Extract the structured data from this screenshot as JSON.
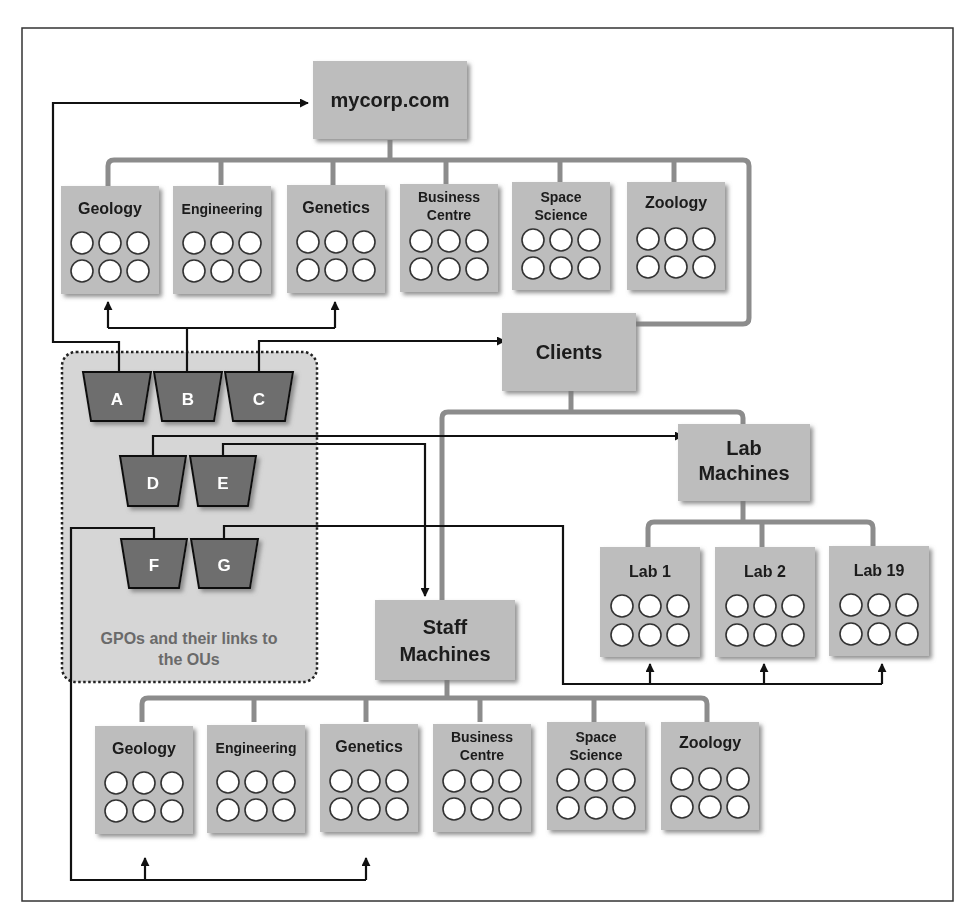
{
  "diagram": {
    "root": {
      "label": "mycorp.com"
    },
    "top_ous": [
      {
        "label_lines": [
          "Geology"
        ]
      },
      {
        "label_lines": [
          "Engineering"
        ]
      },
      {
        "label_lines": [
          "Genetics"
        ]
      },
      {
        "label_lines": [
          "Business",
          "Centre"
        ]
      },
      {
        "label_lines": [
          "Space",
          "Science"
        ]
      },
      {
        "label_lines": [
          "Zoology"
        ]
      }
    ],
    "clients": {
      "label": "Clients"
    },
    "lab_machines": {
      "label_lines": [
        "Lab",
        "Machines"
      ]
    },
    "labs": [
      {
        "label": "Lab 1"
      },
      {
        "label": "Lab 2"
      },
      {
        "label": "Lab 19"
      }
    ],
    "staff_machines": {
      "label_lines": [
        "Staff",
        "Machines"
      ]
    },
    "staff_ous": [
      {
        "label_lines": [
          "Geology"
        ]
      },
      {
        "label_lines": [
          "Engineering"
        ]
      },
      {
        "label_lines": [
          "Genetics"
        ]
      },
      {
        "label_lines": [
          "Business",
          "Centre"
        ]
      },
      {
        "label_lines": [
          "Space",
          "Science"
        ]
      },
      {
        "label_lines": [
          "Zoology"
        ]
      }
    ],
    "gpos": [
      "A",
      "B",
      "C",
      "D",
      "E",
      "F",
      "G"
    ],
    "gpo_caption_lines": [
      "GPOs and their links to",
      "the OUs"
    ],
    "colors": {
      "box_fill": "#bdbdbd",
      "box_shadow": "#8a8a8a",
      "tree_line": "#8c8c8c",
      "gpo_fill": "#6e6e6e",
      "gpo_group_fill": "#d6d6d6",
      "link_line": "#111111"
    }
  }
}
